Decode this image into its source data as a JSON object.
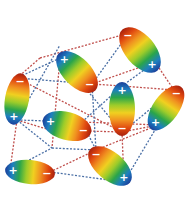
{
  "diagram": {
    "type": "dipole-interaction-network",
    "background": "#ffffff",
    "colors": {
      "attractive_line": "#c0504d",
      "repulsive_line": "#4a6fa5",
      "negative_pole": "#a8200d",
      "positive_pole": "#1b3f9a",
      "sign_text": "#ffffff"
    },
    "gradient_stops": [
      "#1b3f9a",
      "#1e7fc0",
      "#2aa54a",
      "#9ccc2a",
      "#f0d020",
      "#f09020",
      "#e04810",
      "#a8200d"
    ],
    "dipoles": [
      {
        "id": "d1",
        "cx": 140,
        "cy": 50,
        "rx": 15,
        "ry": 27,
        "angle": -40,
        "top_sign": "−",
        "bottom_sign": "+"
      },
      {
        "id": "d2",
        "cx": 77,
        "cy": 72,
        "rx": 14,
        "ry": 26,
        "angle": -45,
        "top_sign": "+",
        "bottom_sign": "−"
      },
      {
        "id": "d3",
        "cx": 17,
        "cy": 99,
        "rx": 12,
        "ry": 26,
        "angle": 10,
        "top_sign": "−",
        "bottom_sign": "+"
      },
      {
        "id": "d4",
        "cx": 122,
        "cy": 109,
        "rx": 13,
        "ry": 27,
        "angle": 0,
        "top_sign": "+",
        "bottom_sign": "−"
      },
      {
        "id": "d5",
        "cx": 166,
        "cy": 108,
        "rx": 13,
        "ry": 26,
        "angle": 35,
        "top_sign": "−",
        "bottom_sign": "+"
      },
      {
        "id": "d6",
        "cx": 67,
        "cy": 126,
        "rx": 14,
        "ry": 25,
        "angle": -75,
        "top_sign": "+",
        "bottom_sign": "−"
      },
      {
        "id": "d7",
        "cx": 110,
        "cy": 166,
        "rx": 14,
        "ry": 26,
        "angle": -50,
        "top_sign": "−",
        "bottom_sign": "+"
      },
      {
        "id": "d8",
        "cx": 30,
        "cy": 172,
        "rx": 12,
        "ry": 25,
        "angle": -85,
        "top_sign": "+",
        "bottom_sign": "−"
      }
    ],
    "links": [
      {
        "x1": 40,
        "y1": 58,
        "x2": 129,
        "y2": 33,
        "kind": "attractive"
      },
      {
        "x1": 40,
        "y1": 58,
        "x2": 17,
        "y2": 78,
        "kind": "attractive"
      },
      {
        "x1": 129,
        "y1": 33,
        "x2": 92,
        "y2": 84,
        "kind": "repulsive"
      },
      {
        "x1": 155,
        "y1": 62,
        "x2": 92,
        "y2": 84,
        "kind": "attractive"
      },
      {
        "x1": 155,
        "y1": 62,
        "x2": 174,
        "y2": 90,
        "kind": "attractive"
      },
      {
        "x1": 155,
        "y1": 62,
        "x2": 122,
        "y2": 86,
        "kind": "repulsive"
      },
      {
        "x1": 92,
        "y1": 84,
        "x2": 122,
        "y2": 86,
        "kind": "attractive"
      },
      {
        "x1": 60,
        "y1": 58,
        "x2": 52,
        "y2": 148,
        "kind": "attractive"
      },
      {
        "x1": 60,
        "y1": 58,
        "x2": 17,
        "y2": 78,
        "kind": "repulsive"
      },
      {
        "x1": 17,
        "y1": 78,
        "x2": 92,
        "y2": 84,
        "kind": "repulsive"
      },
      {
        "x1": 17,
        "y1": 78,
        "x2": 122,
        "y2": 132,
        "kind": "attractive"
      },
      {
        "x1": 17,
        "y1": 120,
        "x2": 50,
        "y2": 130,
        "kind": "attractive"
      },
      {
        "x1": 17,
        "y1": 120,
        "x2": 10,
        "y2": 170,
        "kind": "attractive"
      },
      {
        "x1": 17,
        "y1": 120,
        "x2": 82,
        "y2": 122,
        "kind": "repulsive"
      },
      {
        "x1": 17,
        "y1": 120,
        "x2": 60,
        "y2": 45,
        "kind": "repulsive"
      },
      {
        "x1": 82,
        "y1": 122,
        "x2": 122,
        "y2": 86,
        "kind": "repulsive"
      },
      {
        "x1": 82,
        "y1": 122,
        "x2": 158,
        "y2": 125,
        "kind": "attractive"
      },
      {
        "x1": 82,
        "y1": 122,
        "x2": 96,
        "y2": 150,
        "kind": "repulsive"
      },
      {
        "x1": 50,
        "y1": 130,
        "x2": 122,
        "y2": 132,
        "kind": "attractive"
      },
      {
        "x1": 122,
        "y1": 132,
        "x2": 158,
        "y2": 125,
        "kind": "attractive"
      },
      {
        "x1": 122,
        "y1": 132,
        "x2": 124,
        "y2": 182,
        "kind": "attractive"
      },
      {
        "x1": 122,
        "y1": 86,
        "x2": 174,
        "y2": 90,
        "kind": "attractive"
      },
      {
        "x1": 174,
        "y1": 90,
        "x2": 122,
        "y2": 132,
        "kind": "repulsive"
      },
      {
        "x1": 158,
        "y1": 125,
        "x2": 124,
        "y2": 182,
        "kind": "repulsive"
      },
      {
        "x1": 158,
        "y1": 125,
        "x2": 96,
        "y2": 150,
        "kind": "attractive"
      },
      {
        "x1": 52,
        "y1": 148,
        "x2": 96,
        "y2": 150,
        "kind": "repulsive"
      },
      {
        "x1": 50,
        "y1": 172,
        "x2": 96,
        "y2": 150,
        "kind": "attractive"
      },
      {
        "x1": 50,
        "y1": 172,
        "x2": 124,
        "y2": 182,
        "kind": "repulsive"
      },
      {
        "x1": 10,
        "y1": 170,
        "x2": 52,
        "y2": 148,
        "kind": "repulsive"
      },
      {
        "x1": 17,
        "y1": 120,
        "x2": 52,
        "y2": 148,
        "kind": "repulsive"
      },
      {
        "x1": 92,
        "y1": 84,
        "x2": 96,
        "y2": 150,
        "kind": "repulsive"
      },
      {
        "x1": 60,
        "y1": 58,
        "x2": 122,
        "y2": 132,
        "kind": "repulsive"
      }
    ]
  }
}
